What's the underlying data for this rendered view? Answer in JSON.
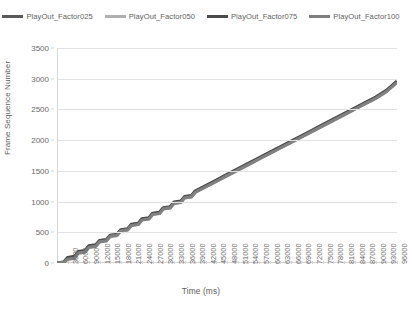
{
  "chart_data": {
    "type": "line",
    "title": "",
    "xlabel": "Time (ms)",
    "ylabel": "Frame Sequence Number",
    "xlim": [
      0,
      96000
    ],
    "ylim": [
      0,
      3500
    ],
    "grid": true,
    "legend_position": "top",
    "x_ticks": [
      "3000",
      "6000",
      "9000",
      "12000",
      "15000",
      "18000",
      "21000",
      "24000",
      "27000",
      "30000",
      "33000",
      "36000",
      "39000",
      "42000",
      "45000",
      "48000",
      "51000",
      "54000",
      "57000",
      "60000",
      "63000",
      "66000",
      "69000",
      "72000",
      "75000",
      "78000",
      "81000",
      "84000",
      "87000",
      "90000",
      "93000",
      "96000"
    ],
    "y_ticks": [
      "0",
      "500",
      "1000",
      "1500",
      "2000",
      "2500",
      "3000",
      "3500"
    ],
    "x": [
      0,
      3000,
      6000,
      9000,
      12000,
      15000,
      18000,
      21000,
      24000,
      27000,
      30000,
      33000,
      36000,
      39000,
      42000,
      45000,
      48000,
      51000,
      54000,
      57000,
      60000,
      63000,
      66000,
      69000,
      72000,
      75000,
      78000,
      81000,
      84000,
      87000,
      90000,
      93000,
      96000
    ],
    "series": [
      {
        "name": "PlayOut_Factor025",
        "color": "#595959",
        "values": [
          0,
          80,
          175,
          270,
          355,
          440,
          530,
          620,
          710,
          800,
          890,
          980,
          1070,
          1160,
          1250,
          1340,
          1430,
          1520,
          1610,
          1700,
          1790,
          1880,
          1970,
          2060,
          2150,
          2240,
          2330,
          2420,
          2510,
          2600,
          2690,
          2800,
          2950
        ]
      },
      {
        "name": "PlayOut_Factor050",
        "color": "#b0b0b0",
        "values": [
          0,
          70,
          165,
          265,
          350,
          430,
          520,
          615,
          705,
          795,
          885,
          975,
          1065,
          1155,
          1245,
          1335,
          1425,
          1515,
          1605,
          1695,
          1785,
          1875,
          1965,
          2055,
          2145,
          2235,
          2325,
          2415,
          2505,
          2595,
          2685,
          2795,
          2945
        ]
      },
      {
        "name": "PlayOut_Factor075",
        "color": "#4a4a4a",
        "values": [
          0,
          90,
          185,
          280,
          365,
          450,
          540,
          630,
          720,
          810,
          900,
          990,
          1080,
          1170,
          1260,
          1350,
          1440,
          1530,
          1620,
          1710,
          1800,
          1890,
          1980,
          2070,
          2160,
          2250,
          2340,
          2430,
          2520,
          2610,
          2700,
          2810,
          2960
        ]
      },
      {
        "name": "PlayOut_Factor100",
        "color": "#808080",
        "values": [
          0,
          60,
          160,
          255,
          345,
          435,
          525,
          610,
          700,
          790,
          880,
          970,
          1060,
          1150,
          1240,
          1330,
          1420,
          1510,
          1600,
          1690,
          1780,
          1870,
          1960,
          2050,
          2140,
          2230,
          2320,
          2410,
          2500,
          2590,
          2680,
          2790,
          2940
        ]
      }
    ]
  }
}
